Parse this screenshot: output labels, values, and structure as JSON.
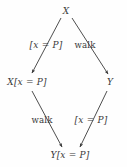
{
  "figure": {
    "type": "commuting-diamond-diagram",
    "background_color": "#fefefe",
    "ink_color": "#3a3a3a",
    "width": 127,
    "height": 167
  },
  "nodes": [
    {
      "id": "top",
      "label": "X",
      "x": 66,
      "y": 11,
      "style": "italic"
    },
    {
      "id": "middle-left",
      "label": "X[x = P]",
      "x": 27,
      "y": 82,
      "style": "italic"
    },
    {
      "id": "middle-right",
      "label": "Y",
      "x": 110,
      "y": 82,
      "style": "italic"
    },
    {
      "id": "bottom",
      "label": "Y[x = P]",
      "x": 70,
      "y": 155,
      "style": "italic"
    }
  ],
  "edges": [
    {
      "id": "top-to-middle-left",
      "from": "top",
      "to": "middle-left",
      "label": "[x = P]",
      "label_style": "italic",
      "label_x": 46,
      "label_y": 45,
      "x1": 61,
      "y1": 18,
      "x2": 32,
      "y2": 73
    },
    {
      "id": "top-to-middle-right",
      "from": "top",
      "to": "middle-right",
      "label": "walk",
      "label_style": "roman",
      "label_x": 85,
      "label_y": 45,
      "x1": 72,
      "y1": 18,
      "x2": 108,
      "y2": 74
    },
    {
      "id": "middle-left-to-bottom",
      "from": "middle-left",
      "to": "bottom",
      "label": "walk",
      "label_style": "roman",
      "label_x": 42,
      "label_y": 120,
      "x1": 32,
      "y1": 91,
      "x2": 62,
      "y2": 147
    },
    {
      "id": "middle-right-to-bottom",
      "from": "middle-right",
      "to": "bottom",
      "label": "[x = P]",
      "label_style": "italic",
      "label_x": 91,
      "label_y": 120,
      "x1": 107,
      "y1": 91,
      "x2": 80,
      "y2": 147
    }
  ]
}
